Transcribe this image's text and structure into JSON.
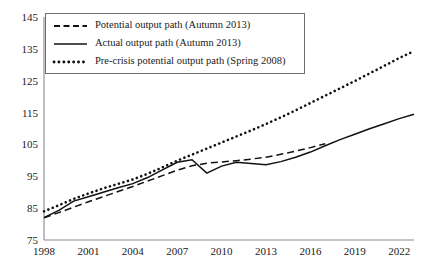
{
  "chart_data": {
    "type": "line",
    "title": "",
    "subtitle": "",
    "xlabel": "",
    "ylabel": "",
    "xlim": [
      1998,
      2023
    ],
    "ylim": [
      75,
      145
    ],
    "grid": false,
    "legend_position": "top-left",
    "x_ticks": [
      "1998",
      "2001",
      "2004",
      "2007",
      "2010",
      "2013",
      "2016",
      "2019",
      "2022"
    ],
    "x_tick_values": [
      1998,
      2001,
      2004,
      2007,
      2010,
      2013,
      2016,
      2019,
      2022
    ],
    "y_ticks": [
      "75",
      "85",
      "95",
      "105",
      "115",
      "125",
      "135",
      "145"
    ],
    "y_tick_values": [
      75,
      85,
      95,
      105,
      115,
      125,
      135,
      145
    ],
    "x": [
      1998,
      1999,
      2000,
      2001,
      2002,
      2003,
      2004,
      2005,
      2006,
      2007,
      2008,
      2009,
      2010,
      2011,
      2012,
      2013,
      2014,
      2015,
      2016,
      2017,
      2018,
      2019,
      2020,
      2021,
      2022,
      2023
    ],
    "series": [
      {
        "name": "Potential output path (Autumn 2013)",
        "style": "dashed",
        "color": "#111111",
        "x": [
          1998,
          1999,
          2000,
          2001,
          2002,
          2003,
          2004,
          2005,
          2006,
          2007,
          2008,
          2009,
          2010,
          2011,
          2012,
          2013,
          2014,
          2015,
          2016,
          2017
        ],
        "values": [
          82.0,
          83.6,
          85.3,
          87.0,
          88.6,
          90.2,
          91.8,
          93.5,
          95.2,
          96.9,
          98.3,
          99.1,
          99.5,
          99.9,
          100.4,
          101.0,
          101.9,
          102.9,
          104.0,
          105.2
        ]
      },
      {
        "name": "Actual output path (Autumn 2013)",
        "style": "solid",
        "color": "#111111",
        "x": [
          1998,
          1999,
          2000,
          2001,
          2002,
          2003,
          2004,
          2005,
          2006,
          2007,
          2008,
          2009,
          2010,
          2011,
          2012,
          2013,
          2014,
          2015,
          2016,
          2017,
          2018,
          2019,
          2020,
          2021,
          2022,
          2023
        ],
        "values": [
          82.0,
          84.3,
          87.2,
          88.6,
          90.0,
          91.4,
          92.7,
          94.6,
          97.0,
          99.4,
          100.2,
          96.0,
          98.2,
          99.4,
          99.0,
          98.6,
          99.6,
          101.0,
          102.6,
          104.6,
          106.5,
          108.2,
          109.9,
          111.5,
          113.1,
          114.5
        ]
      },
      {
        "name": "Pre-crisis potential output path (Spring 2008)",
        "style": "dotted",
        "color": "#111111",
        "x": [
          1998,
          1999,
          2000,
          2001,
          2002,
          2003,
          2004,
          2005,
          2006,
          2007,
          2008,
          2009,
          2010,
          2011,
          2012,
          2013,
          2014,
          2015,
          2016,
          2017,
          2018,
          2019,
          2020,
          2021,
          2022,
          2023
        ],
        "values": [
          84.0,
          85.9,
          87.9,
          89.6,
          91.2,
          92.6,
          94.0,
          95.8,
          97.8,
          99.9,
          101.8,
          103.7,
          105.6,
          107.5,
          109.4,
          111.4,
          113.5,
          115.7,
          118.0,
          120.3,
          122.6,
          124.9,
          127.3,
          129.7,
          132.1,
          134.3
        ]
      }
    ]
  },
  "legend": {
    "entries": [
      {
        "label": "Potential output path (Autumn 2013)"
      },
      {
        "label": "Actual output path (Autumn 2013)"
      },
      {
        "label": "Pre-crisis potential output path (Spring 2008)"
      }
    ]
  },
  "colors": {
    "ink": "#111111",
    "axis": "#8a8a8a",
    "background": "#ffffff"
  }
}
